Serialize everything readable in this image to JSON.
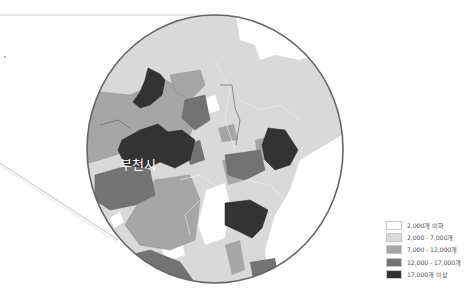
{
  "map": {
    "highlight_label": "부천시",
    "colors": {
      "class1": "#ffffff",
      "class2": "#d9d9d9",
      "class3": "#a6a6a6",
      "class4": "#737373",
      "class5": "#333333",
      "outline": "#555555",
      "callout_line": "#cfcfcf"
    }
  },
  "legend": {
    "items": [
      {
        "label": "2,000개 이하",
        "color": "#ffffff"
      },
      {
        "label": "2,000 - 7,000개",
        "color": "#d9d9d9"
      },
      {
        "label": "7,000 - 12,000개",
        "color": "#a6a6a6"
      },
      {
        "label": "12,000 - 17,000개",
        "color": "#737373"
      },
      {
        "label": "17,000개 이상",
        "color": "#333333"
      }
    ]
  }
}
